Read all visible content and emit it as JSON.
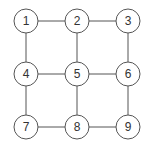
{
  "diagram": {
    "type": "grid-graph",
    "stroke_color": "#555555",
    "node_fill": "#ffffff",
    "nodes": [
      {
        "id": "1",
        "label": "1",
        "x": 26,
        "y": 21
      },
      {
        "id": "2",
        "label": "2",
        "x": 77,
        "y": 21
      },
      {
        "id": "3",
        "label": "3",
        "x": 128,
        "y": 21
      },
      {
        "id": "4",
        "label": "4",
        "x": 26,
        "y": 74
      },
      {
        "id": "5",
        "label": "5",
        "x": 77,
        "y": 74
      },
      {
        "id": "6",
        "label": "6",
        "x": 128,
        "y": 74
      },
      {
        "id": "7",
        "label": "7",
        "x": 26,
        "y": 127
      },
      {
        "id": "8",
        "label": "8",
        "x": 77,
        "y": 127
      },
      {
        "id": "9",
        "label": "9",
        "x": 128,
        "y": 127
      }
    ],
    "edges": [
      [
        "1",
        "2"
      ],
      [
        "2",
        "3"
      ],
      [
        "4",
        "5"
      ],
      [
        "5",
        "6"
      ],
      [
        "7",
        "8"
      ],
      [
        "8",
        "9"
      ],
      [
        "1",
        "4"
      ],
      [
        "4",
        "7"
      ],
      [
        "2",
        "5"
      ],
      [
        "5",
        "8"
      ],
      [
        "3",
        "6"
      ],
      [
        "6",
        "9"
      ]
    ],
    "node_radius": 12
  }
}
